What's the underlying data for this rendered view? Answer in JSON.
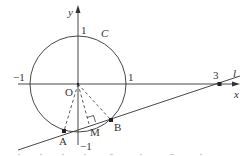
{
  "diagram": {
    "type": "coordinate-geometry",
    "colors": {
      "stroke": "#333333",
      "background": "#ffffff",
      "faint": "#bbbbbb"
    },
    "axes": {
      "x_label": "x",
      "y_label": "y",
      "origin_label": "O",
      "ticks": {
        "x_pos1": "1",
        "x_neg1": "−1",
        "x_3": "3",
        "y_pos1": "1",
        "y_neg1": "−1"
      }
    },
    "circle": {
      "label": "C",
      "center": [
        0,
        0
      ],
      "radius": 1
    },
    "line": {
      "label": "l",
      "passes_through": [
        3,
        0
      ]
    },
    "points": {
      "A": {
        "label": "A"
      },
      "B": {
        "label": "B"
      },
      "M": {
        "label": "M",
        "note": "foot of perpendicular from O to AB"
      }
    }
  }
}
